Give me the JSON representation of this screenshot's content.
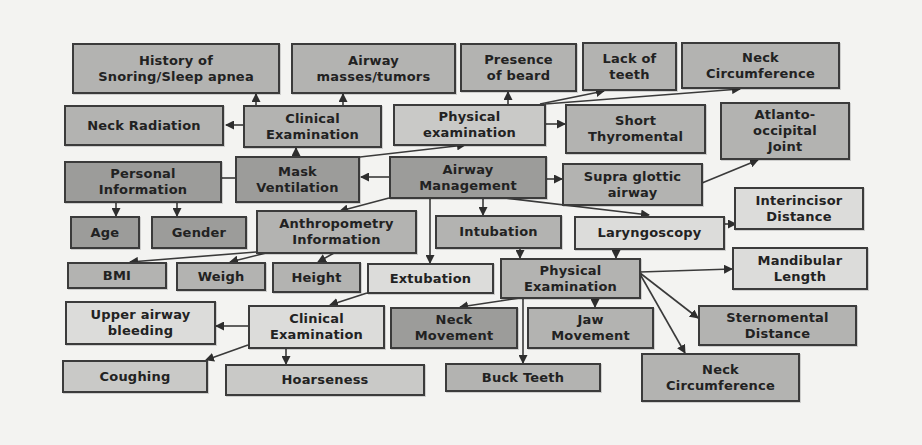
{
  "diagram": {
    "title": "",
    "colors": {
      "background": "#f3f3f1",
      "border": "#3b3b3b",
      "fill_lightest": "#dcdcda",
      "fill_light": "#c9c9c7",
      "fill_medium": "#b3b3b1",
      "fill_dark": "#9c9c9a"
    },
    "nodes": {
      "history_snoring": {
        "line1": "History of",
        "line2": "Snoring/Sleep apnea"
      },
      "airway_masses": {
        "line1": "Airway",
        "line2": "masses/tumors"
      },
      "presence_beard": {
        "line1": "Presence",
        "line2": "of beard"
      },
      "lack_teeth": {
        "line1": "Lack of",
        "line2": "teeth"
      },
      "neck_circ_top": {
        "line1": "Neck",
        "line2": "Circumference"
      },
      "neck_radiation": {
        "line1": "Neck Radiation"
      },
      "clinical_exam_top": {
        "line1": "Clinical",
        "line2": "Examination"
      },
      "physical_exam_top": {
        "line1": "Physical",
        "line2": "examination"
      },
      "short_thyromental": {
        "line1": "Short",
        "line2": "Thyromental",
        "line3": "..."
      },
      "atlanto_occipital": {
        "line1": "Atlanto-",
        "line2": "occipital",
        "line3": "Joint"
      },
      "personal_info": {
        "line1": "Personal",
        "line2": "Information"
      },
      "mask_ventilation": {
        "line1": "Mask",
        "line2": "Ventilation"
      },
      "airway_management": {
        "line1": "Airway",
        "line2": "Management"
      },
      "supra_glottic": {
        "line1": "Supra glottic",
        "line2": "airway"
      },
      "interincisor": {
        "line1": "Interincisor",
        "line2": "Distance"
      },
      "age": {
        "line1": "Age"
      },
      "gender": {
        "line1": "Gender"
      },
      "anthropometry": {
        "line1": "Anthropometry",
        "line2": "Information"
      },
      "intubation": {
        "line1": "Intubation"
      },
      "laryngoscopy": {
        "line1": "Laryngoscopy"
      },
      "bmi": {
        "line1": "BMI"
      },
      "weigh": {
        "line1": "Weigh"
      },
      "height": {
        "line1": "Height"
      },
      "extubation": {
        "line1": "Extubation"
      },
      "physical_exam_mid": {
        "line1": "Physical",
        "line2": "Examination"
      },
      "mandibular_length": {
        "line1": "Mandibular",
        "line2": "Length"
      },
      "upper_airway_bleeding": {
        "line1": "Upper airway",
        "line2": "bleeding"
      },
      "clinical_exam_bottom": {
        "line1": "Clinical",
        "line2": "Examination"
      },
      "neck_movement": {
        "line1": "Neck",
        "line2": "Movement"
      },
      "jaw_movement": {
        "line1": "Jaw",
        "line2": "Movement"
      },
      "sternomental": {
        "line1": "Sternomental",
        "line2": "Distance"
      },
      "coughing": {
        "line1": "Coughing"
      },
      "hoarseness": {
        "line1": "Hoarseness"
      },
      "buck_teeth": {
        "line1": "Buck Teeth"
      },
      "neck_circ_bottom": {
        "line1": "Neck",
        "line2": "Circumference"
      }
    },
    "edges": [
      [
        "airway_management",
        "mask_ventilation"
      ],
      [
        "airway_management",
        "physical_exam_top"
      ],
      [
        "airway_management",
        "supra_glottic"
      ],
      [
        "airway_management",
        "anthropometry"
      ],
      [
        "airway_management",
        "intubation"
      ],
      [
        "airway_management",
        "laryngoscopy"
      ],
      [
        "airway_management",
        "extubation"
      ],
      [
        "mask_ventilation",
        "personal_info"
      ],
      [
        "mask_ventilation",
        "clinical_exam_top"
      ],
      [
        "clinical_exam_top",
        "neck_radiation"
      ],
      [
        "clinical_exam_top",
        "history_snoring"
      ],
      [
        "clinical_exam_top",
        "airway_masses"
      ],
      [
        "physical_exam_top",
        "presence_beard"
      ],
      [
        "physical_exam_top",
        "lack_teeth"
      ],
      [
        "physical_exam_top",
        "neck_circ_top"
      ],
      [
        "physical_exam_top",
        "short_thyromental"
      ],
      [
        "supra_glottic",
        "atlanto_occipital"
      ],
      [
        "personal_info",
        "age"
      ],
      [
        "personal_info",
        "gender"
      ],
      [
        "anthropometry",
        "bmi"
      ],
      [
        "anthropometry",
        "weigh"
      ],
      [
        "anthropometry",
        "height"
      ],
      [
        "intubation",
        "physical_exam_mid"
      ],
      [
        "laryngoscopy",
        "physical_exam_mid"
      ],
      [
        "laryngoscopy",
        "interincisor"
      ],
      [
        "extubation",
        "clinical_exam_bottom"
      ],
      [
        "physical_exam_mid",
        "mandibular_length"
      ],
      [
        "physical_exam_mid",
        "sternomental"
      ],
      [
        "physical_exam_mid",
        "neck_circ_bottom"
      ],
      [
        "physical_exam_mid",
        "jaw_movement"
      ],
      [
        "physical_exam_mid",
        "neck_movement"
      ],
      [
        "physical_exam_mid",
        "buck_teeth"
      ],
      [
        "clinical_exam_bottom",
        "upper_airway_bleeding"
      ],
      [
        "clinical_exam_bottom",
        "coughing"
      ],
      [
        "clinical_exam_bottom",
        "hoarseness"
      ]
    ]
  }
}
